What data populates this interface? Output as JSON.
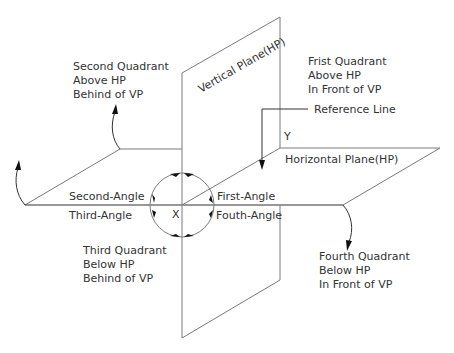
{
  "planes": {
    "vertical": "Vertical Plane(HP)",
    "horizontal": "Horizontal Plane(HP)"
  },
  "reference_line": "Reference Line",
  "axes": {
    "x": "X",
    "y": "Y"
  },
  "angles": {
    "first": "First-Angle",
    "second": "Second-Angle",
    "third": "Third-Angle",
    "fourth": "Fouth-Angle"
  },
  "quadrants": {
    "first": {
      "title": "Frist Quadrant",
      "line1": "Above HP",
      "line2": "In Front of VP"
    },
    "second": {
      "title": "Second Quadrant",
      "line1": "Above HP",
      "line2": "Behind of VP"
    },
    "third": {
      "title": "Third Quadrant",
      "line1": "Below HP",
      "line2": "Behind of VP"
    },
    "fourth": {
      "title": "Fourth Quadrant",
      "line1": "Below HP",
      "line2": "In Front of VP"
    }
  },
  "colors": {
    "line": "#7a7a7a",
    "text": "#333333",
    "arrow": "#111111"
  }
}
